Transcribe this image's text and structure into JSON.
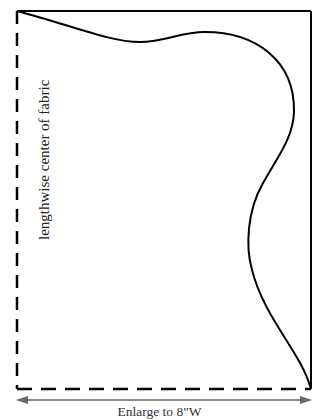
{
  "diagram": {
    "type": "sewing-pattern-piece",
    "fold_label": "lengthwise center of fabric",
    "dimension_label": "Enlarge to 8\"W",
    "colors": {
      "outline": "#000000",
      "arrow": "#666666",
      "text": "#222222"
    },
    "edges": {
      "top": "solid",
      "right": "solid",
      "left": "dashed (fold line)",
      "bottom": "dashed"
    }
  }
}
